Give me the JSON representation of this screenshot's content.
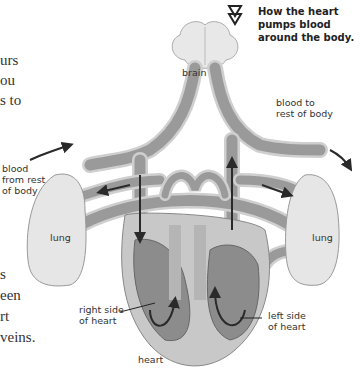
{
  "page_text": {
    "top_fragments": [
      "urs",
      "ou",
      "s to"
    ],
    "bottom_fragments": [
      "s",
      "een",
      "rt",
      "veins."
    ]
  },
  "diagram": {
    "title": "How the heart\npumps blood\naround the body.",
    "title_icon": "double-down-triangle-icon",
    "labels": {
      "brain": "brain",
      "blood_to": "blood to\nrest of body",
      "blood_from": "blood\nfrom rest\nof body",
      "lung_left": "lung",
      "lung_right": "lung",
      "right_side": "right side\nof heart",
      "left_side": "left side\nof heart",
      "heart": "heart"
    }
  },
  "colors": {
    "vessel_fill": "#9a9a9a",
    "vessel_edge": "#d9d9d9",
    "heart_outer": "#c8c8c8",
    "chamber": "#8c8c8c",
    "organ": "#e6e6e6",
    "arrow": "#2a2a2a"
  }
}
